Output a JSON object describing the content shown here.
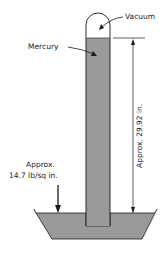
{
  "diagram": {
    "type": "mercury-barometer",
    "labels": {
      "vacuum": "Vacuum",
      "mercury": "Mercury",
      "pressure_line1": "Approx.",
      "pressure_line2": "14.7 lb/sq in.",
      "height": "Approx. 29.92 in."
    },
    "colors": {
      "mercury_fill": "#9a9a9a",
      "line": "#1a1a1a",
      "background": "#ffffff"
    }
  }
}
